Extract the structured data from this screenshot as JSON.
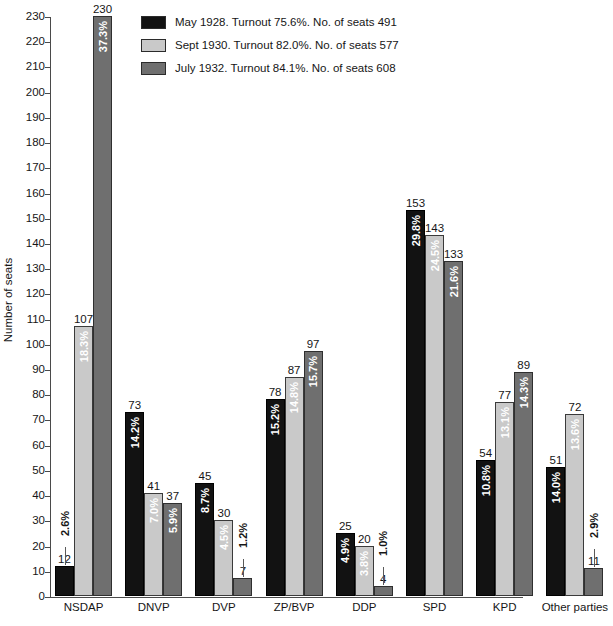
{
  "legend": {
    "items": [
      {
        "swatch_color": "#121212",
        "label": "May 1928. Turnout 75.6%. No. of seats 491"
      },
      {
        "swatch_color": "#c9c9c9",
        "label": "Sept 1930. Turnout 82.0%. No. of seats 577"
      },
      {
        "swatch_color": "#6f6f6f",
        "label": "July 1932. Turnout 84.1%. No. of seats 608"
      }
    ]
  },
  "axes": {
    "ylabel": "Number of seats",
    "yticks": [
      "0",
      "10",
      "20",
      "30",
      "40",
      "50",
      "60",
      "70",
      "80",
      "90",
      "100",
      "110",
      "120",
      "130",
      "140",
      "150",
      "160",
      "170",
      "180",
      "190",
      "200",
      "210",
      "220",
      "230"
    ]
  },
  "chart_data": {
    "type": "bar",
    "title": "",
    "xlabel": "",
    "ylabel": "Number of seats",
    "ylim": [
      0,
      230
    ],
    "ytick_step": 10,
    "grid": false,
    "legend_position": "top-center",
    "categories": [
      "NSDAP",
      "DNVP",
      "DVP",
      "ZP/BVP",
      "DDP",
      "SPD",
      "KPD",
      "Other parties"
    ],
    "series": [
      {
        "name": "May 1928. Turnout 75.6%. No. of seats 491",
        "short_name": "May 1928",
        "color": "#121212",
        "turnout": "75.6%",
        "total_seats": 491,
        "values": [
          12,
          73,
          45,
          78,
          25,
          153,
          54,
          51
        ],
        "percent_labels": [
          "2.6%",
          "14.2%",
          "8.7%",
          "15.2%",
          "4.9%",
          "29.8%",
          "10.8%",
          "14.0%"
        ]
      },
      {
        "name": "Sept 1930. Turnout 82.0%. No. of seats 577",
        "short_name": "Sept 1930",
        "color": "#c9c9c9",
        "turnout": "82.0%",
        "total_seats": 577,
        "values": [
          107,
          41,
          30,
          87,
          20,
          143,
          77,
          72
        ],
        "percent_labels": [
          "18.3%",
          "7.0%",
          "4.5%",
          "14.8%",
          "3.8%",
          "24.5%",
          "13.1%",
          "13.6%"
        ]
      },
      {
        "name": "July 1932. Turnout 84.1%. No. of seats 608",
        "short_name": "July 1932",
        "color": "#6f6f6f",
        "turnout": "84.1%",
        "total_seats": 608,
        "values": [
          230,
          37,
          7,
          97,
          4,
          133,
          89,
          11
        ],
        "percent_labels": [
          "37.3%",
          "5.9%",
          "1.2%",
          "15.7%",
          "1.0%",
          "21.6%",
          "14.3%",
          "2.9%"
        ]
      }
    ]
  }
}
